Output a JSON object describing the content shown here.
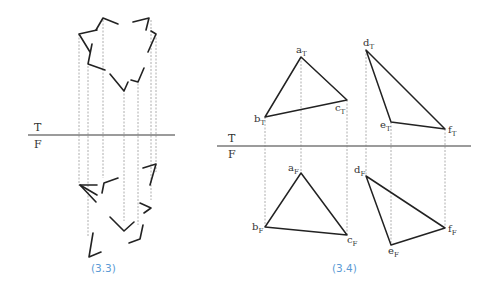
{
  "figures": [
    {
      "id": "fig-3-3",
      "caption": "(3.3)",
      "plane_labels": {
        "top": "T",
        "front": "F"
      },
      "description": "Projection of open-cornered polygon fragments between top and front views"
    },
    {
      "id": "fig-3-4",
      "caption": "(3.4)",
      "plane_labels": {
        "top": "T",
        "front": "F"
      },
      "top_view_points": [
        {
          "name": "a",
          "sub": "T"
        },
        {
          "name": "b",
          "sub": "T"
        },
        {
          "name": "c",
          "sub": "T"
        },
        {
          "name": "d",
          "sub": "T"
        },
        {
          "name": "e",
          "sub": "T"
        },
        {
          "name": "f",
          "sub": "T"
        }
      ],
      "front_view_points": [
        {
          "name": "a",
          "sub": "F"
        },
        {
          "name": "b",
          "sub": "F"
        },
        {
          "name": "c",
          "sub": "F"
        },
        {
          "name": "d",
          "sub": "F"
        },
        {
          "name": "e",
          "sub": "F"
        },
        {
          "name": "f",
          "sub": "F"
        }
      ]
    }
  ],
  "colors": {
    "caption": "#5b9bd5",
    "line": "#222222",
    "reference_line": "#7a7a7a",
    "projector": "#9a9a9a"
  }
}
